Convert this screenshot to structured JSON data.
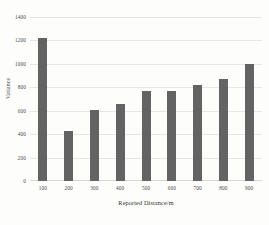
{
  "chart_data": {
    "type": "bar",
    "title": "",
    "xlabel": "Reported Distance/m",
    "ylabel": "Variance",
    "categories": [
      "100",
      "200",
      "300",
      "400",
      "500",
      "600",
      "700",
      "800",
      "900"
    ],
    "values": [
      1225,
      425,
      605,
      660,
      765,
      765,
      820,
      875,
      1000
    ],
    "series": [
      {
        "name": "Variance",
        "values": [
          1225,
          425,
          605,
          660,
          765,
          765,
          820,
          875,
          1000
        ]
      }
    ],
    "ylim": [
      0,
      1400
    ],
    "y_ticks": [
      0,
      200,
      400,
      600,
      800,
      1000,
      1200,
      1400
    ],
    "y_tick_labels": [
      "0",
      "200",
      "400",
      "600",
      "800",
      "1000",
      "1200",
      "1400"
    ],
    "grid": "horizontal",
    "legend": "none",
    "bar_color": "#636363",
    "gridline_color": "#e6e6e6",
    "background_color": "#fdfdfc"
  }
}
